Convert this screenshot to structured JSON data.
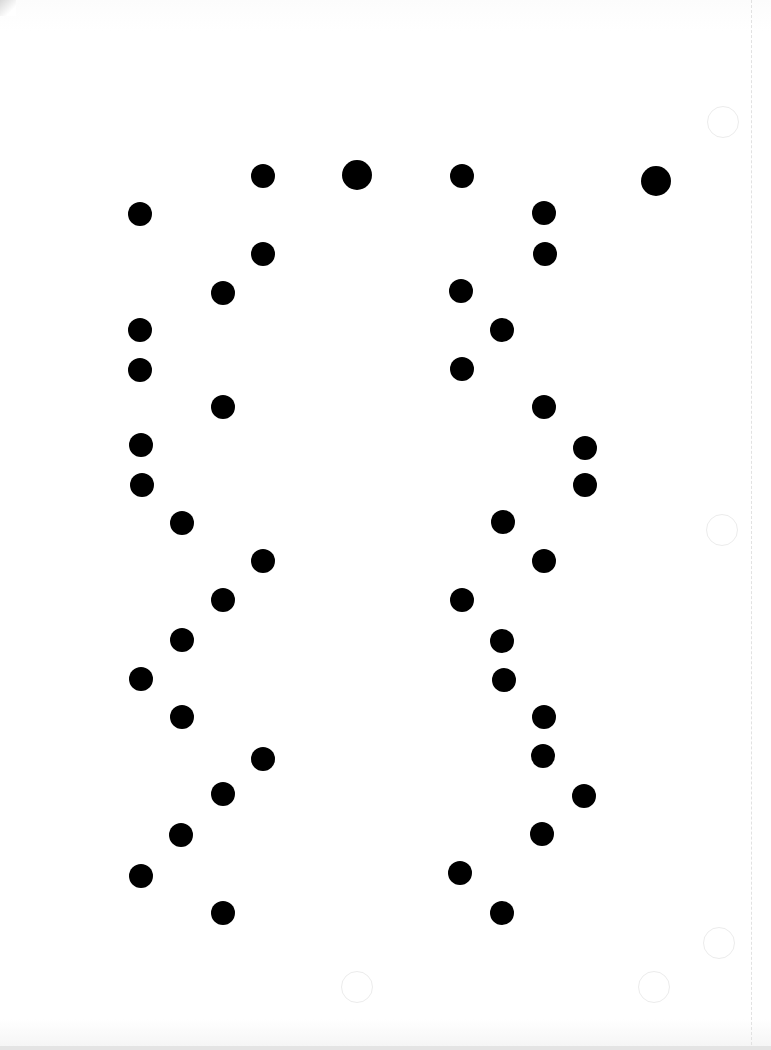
{
  "page": {
    "width": 771,
    "height": 1050,
    "background": "#ffffff",
    "dot_color": "#000000"
  },
  "dots": [
    {
      "x": 263,
      "y": 176,
      "d": 24
    },
    {
      "x": 357,
      "y": 175,
      "d": 30
    },
    {
      "x": 462,
      "y": 176,
      "d": 24
    },
    {
      "x": 656,
      "y": 181,
      "d": 30
    },
    {
      "x": 140,
      "y": 214,
      "d": 24
    },
    {
      "x": 544,
      "y": 213,
      "d": 24
    },
    {
      "x": 263,
      "y": 254,
      "d": 24
    },
    {
      "x": 545,
      "y": 254,
      "d": 24
    },
    {
      "x": 223,
      "y": 293,
      "d": 24
    },
    {
      "x": 461,
      "y": 291,
      "d": 24
    },
    {
      "x": 140,
      "y": 330,
      "d": 24
    },
    {
      "x": 502,
      "y": 330,
      "d": 24
    },
    {
      "x": 140,
      "y": 370,
      "d": 24
    },
    {
      "x": 462,
      "y": 369,
      "d": 24
    },
    {
      "x": 223,
      "y": 407,
      "d": 24
    },
    {
      "x": 544,
      "y": 407,
      "d": 24
    },
    {
      "x": 141,
      "y": 445,
      "d": 24
    },
    {
      "x": 585,
      "y": 448,
      "d": 24
    },
    {
      "x": 142,
      "y": 485,
      "d": 24
    },
    {
      "x": 585,
      "y": 485,
      "d": 24
    },
    {
      "x": 182,
      "y": 523,
      "d": 24
    },
    {
      "x": 503,
      "y": 522,
      "d": 24
    },
    {
      "x": 263,
      "y": 561,
      "d": 24
    },
    {
      "x": 544,
      "y": 561,
      "d": 24
    },
    {
      "x": 223,
      "y": 600,
      "d": 24
    },
    {
      "x": 462,
      "y": 600,
      "d": 24
    },
    {
      "x": 182,
      "y": 640,
      "d": 24
    },
    {
      "x": 502,
      "y": 641,
      "d": 24
    },
    {
      "x": 141,
      "y": 679,
      "d": 24
    },
    {
      "x": 504,
      "y": 680,
      "d": 24
    },
    {
      "x": 182,
      "y": 717,
      "d": 24
    },
    {
      "x": 544,
      "y": 717,
      "d": 24
    },
    {
      "x": 263,
      "y": 759,
      "d": 24
    },
    {
      "x": 543,
      "y": 756,
      "d": 24
    },
    {
      "x": 223,
      "y": 794,
      "d": 24
    },
    {
      "x": 584,
      "y": 796,
      "d": 24
    },
    {
      "x": 181,
      "y": 835,
      "d": 24
    },
    {
      "x": 542,
      "y": 834,
      "d": 24
    },
    {
      "x": 141,
      "y": 876,
      "d": 24
    },
    {
      "x": 460,
      "y": 873,
      "d": 24
    },
    {
      "x": 223,
      "y": 913,
      "d": 24
    },
    {
      "x": 502,
      "y": 913,
      "d": 24
    }
  ],
  "faint_circles": [
    {
      "x": 723,
      "y": 122,
      "d": 30
    },
    {
      "x": 722,
      "y": 530,
      "d": 30
    },
    {
      "x": 719,
      "y": 943,
      "d": 30
    },
    {
      "x": 654,
      "y": 987,
      "d": 30
    },
    {
      "x": 357,
      "y": 987,
      "d": 30
    }
  ],
  "dashed_line": {
    "x": 751
  }
}
